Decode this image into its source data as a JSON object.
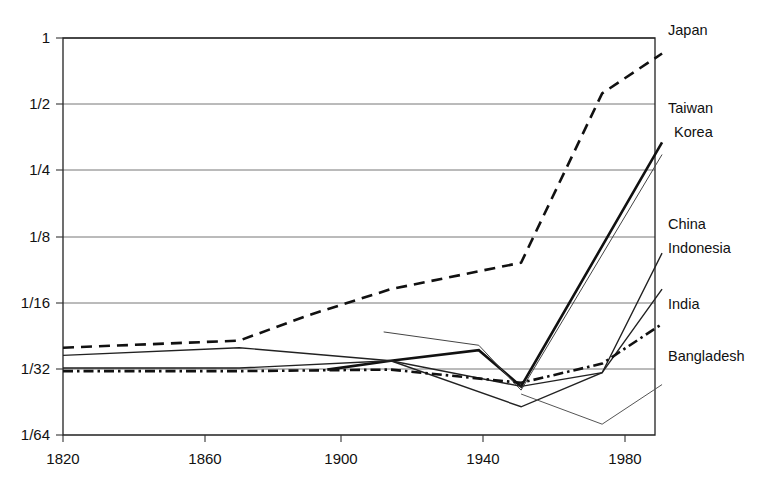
{
  "chart_data": {
    "type": "line",
    "title": "",
    "subtitle": "",
    "xlabel": "",
    "ylabel": "",
    "grid": "horizontal",
    "legend_position": "right-inline-labels",
    "xlim": [
      1820,
      1988
    ],
    "ylim_log2": [
      -6,
      0
    ],
    "x_ticks": [
      1820,
      1860,
      1900,
      1940,
      1980
    ],
    "x_tick_labels": [
      "1820",
      "1860",
      "1900",
      "1940",
      "1980"
    ],
    "y_ticks": [
      1,
      0.5,
      0.25,
      0.125,
      0.0625,
      0.03125,
      0.015625
    ],
    "y_tick_labels": [
      "1",
      "1/2",
      "1/4",
      "1/8",
      "1/16",
      "1/32",
      "1/64"
    ],
    "series": [
      {
        "name": "Japan",
        "label": "Japan",
        "style": "dashed",
        "width": "thick",
        "color": "#111111",
        "x": [
          1820,
          1870,
          1890,
          1913,
          1950,
          1973,
          1990
        ],
        "y": [
          0.039,
          0.042,
          0.055,
          0.072,
          0.095,
          0.56,
          0.85
        ]
      },
      {
        "name": "Taiwan",
        "label": "Taiwan",
        "style": "solid",
        "width": "thick",
        "color": "#111111",
        "x": [
          1895,
          1913,
          1938,
          1950,
          1990
        ],
        "y": [
          0.031,
          0.034,
          0.038,
          0.026,
          0.335
        ]
      },
      {
        "name": "Korea",
        "label": "Korea",
        "style": "solid",
        "width": "thin",
        "color": "#444444",
        "x": [
          1911,
          1938,
          1950,
          1990
        ],
        "y": [
          0.046,
          0.04,
          0.025,
          0.295
        ]
      },
      {
        "name": "China",
        "label": "China",
        "style": "solid",
        "width": "medium",
        "color": "#222222",
        "x": [
          1820,
          1870,
          1913,
          1950,
          1973,
          1990
        ],
        "y": [
          0.036,
          0.039,
          0.034,
          0.021,
          0.03,
          0.105
        ]
      },
      {
        "name": "Indonesia",
        "label": "Indonesia",
        "style": "solid",
        "width": "medium",
        "color": "#222222",
        "x": [
          1820,
          1870,
          1913,
          1950,
          1973,
          1990
        ],
        "y": [
          0.0315,
          0.0315,
          0.034,
          0.026,
          0.03,
          0.072
        ]
      },
      {
        "name": "India",
        "label": "India",
        "style": "dash-dot",
        "width": "thick",
        "color": "#111111",
        "x": [
          1820,
          1870,
          1913,
          1950,
          1973,
          1990
        ],
        "y": [
          0.0305,
          0.0305,
          0.031,
          0.027,
          0.033,
          0.05
        ]
      },
      {
        "name": "Bangladesh",
        "label": "Bangladesh",
        "style": "solid",
        "width": "thin",
        "color": "#555555",
        "x": [
          1950,
          1973,
          1990
        ],
        "y": [
          0.024,
          0.0175,
          0.0265
        ]
      }
    ]
  },
  "axis": {
    "y_labels": [
      "1",
      "1/2",
      "1/4",
      "1/8",
      "1/16",
      "1/32",
      "1/64"
    ],
    "x_labels": [
      "1820",
      "1860",
      "1900",
      "1940",
      "1980"
    ]
  },
  "series_labels": {
    "japan": "Japan",
    "taiwan": "Taiwan",
    "korea": "Korea",
    "china": "China",
    "indonesia": "Indonesia",
    "india": "India",
    "bangladesh": "Bangladesh"
  }
}
